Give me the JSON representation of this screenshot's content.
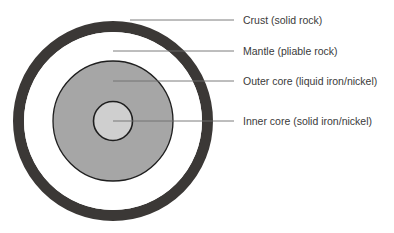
{
  "diagram": {
    "title": "",
    "colors": {
      "background": "#ffffff",
      "crust": "#3b3836",
      "mantle": "#ffffff",
      "outer_core": "#a6a6a6",
      "inner_core": "#cfcfcf",
      "outline": "#1e1e1e",
      "leader_line": "#6e6e6e",
      "label_text": "#3a3a3a"
    },
    "layers": [
      {
        "id": "crust",
        "label": "Crust (solid rock)"
      },
      {
        "id": "mantle",
        "label": "Mantle (pliable rock)"
      },
      {
        "id": "outer_core",
        "label": "Outer core (liquid iron/nickel)"
      },
      {
        "id": "inner_core",
        "label": "Inner core (solid iron/nickel)"
      }
    ]
  }
}
